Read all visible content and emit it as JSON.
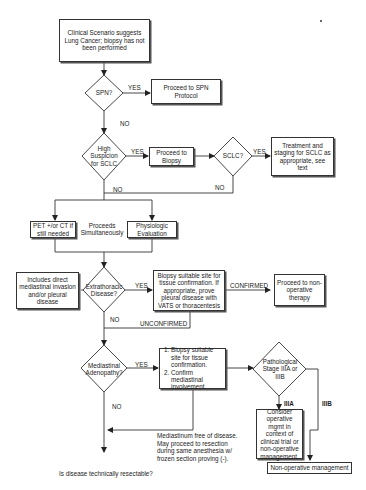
{
  "nodes": {
    "start": "Clinical Scenario suggests Lung Cancer; biopsy has not been performed",
    "spn_decision": "SPN?",
    "spn_protocol": "Proceed to SPN Protocol",
    "high_suspicion_decision": "High Suspicion for SCLC",
    "proceed_biopsy": "Proceed to Biopsy",
    "sclc_decision": "SCLC?",
    "sclc_treatment": "Treatment and staging for SCLC as appropriate, see text",
    "pet_ct": "PET +/or CT if still needed",
    "proceeds_simultaneously": "Proceeds Simultaneously",
    "physiologic_eval": "Physiologic Evaluation",
    "includes_direct": "Includes direct mediastinal invasion and/or pleural disease",
    "extrathoracic_decision": "Extrathoracic Disease?",
    "biopsy_site": "Biopsy suitable site for tissue confirmation. If appropriate, prove pleural disease with VATS or thoracentesis",
    "non_operative_therapy": "Proceed to non-operative therapy",
    "mediastinal_decision": "Mediastinal Adenopathy?",
    "mediastinal_steps": [
      "Biopsy suitable site for tissue confirmation.",
      "Confirm mediastinal involvement."
    ],
    "pathological_stage_decision": "Pathological Stage IIIA or IIIB",
    "consider_operative": "Consider operative mgmt in context of clinical trial or non-operative management.",
    "non_operative_mgmt": "Non-operative management",
    "mediastinum_free": "Mediastinum free of disease. May proceed to resection during same anesthesia w/ frozen section proving (-).",
    "resectable_question": "Is disease technically resectable?"
  },
  "edge_labels": {
    "spn_yes": "YES",
    "spn_no": "NO",
    "suspicion_yes": "YES",
    "suspicion_no": "NO",
    "sclc_yes": "YES",
    "sclc_no": "NO",
    "extrathoracic_yes": "YES",
    "extrathoracic_no": "NO",
    "confirmed": "CONFIRMED",
    "unconfirmed": "UNCONFIRMED",
    "mediastinal_yes": "YES",
    "mediastinal_no": "NO",
    "stage_iiia": "IIIA",
    "stage_iiib": "IIIB"
  },
  "colors": {
    "line": "#333333",
    "background": "#ffffff"
  }
}
